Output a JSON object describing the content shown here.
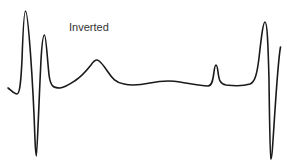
{
  "diagram": {
    "title": "Inverted",
    "stroke_color": "#1a1a1a",
    "stroke_width": 1.6,
    "waveform_path": "M 8 88 C 11 90, 14 94, 17 94 C 20 94, 21 80, 22 60 C 23 30, 24 11, 25.5 11 C 28 11, 33 80, 35 140 C 35.5 152, 36 156, 36.5 156 C 37 156, 39 100, 41 60 C 42 42, 43 35, 44.5 35 C 46 35, 47 55, 49 75 C 50.5 86, 53 88, 60 88 C 66 87, 70 84, 76 80 C 82 76, 87 70, 91 65 C 93 62, 95 60, 97 60 C 100 60, 104 66, 108 72 C 112 78, 116 83, 124 84 C 132 86, 140 85, 150 83 C 160 81, 168 80, 180 82 C 192 84, 200 86, 208 86 C 212 86, 213 80, 214 72 C 214.5 68, 215 65, 216 65 C 217 65, 217.5 68, 218 72 C 219 80, 220 84, 226 85 C 234 86, 244 86, 250 84 C 255 82, 257 74, 259 58 C 261 40, 263 22, 265 22 C 267 22, 268 40, 269 80 C 269.5 120, 270 158, 271 159 C 272 159, 273 140, 275 110 C 277 80, 279 55, 280.5 47"
  }
}
